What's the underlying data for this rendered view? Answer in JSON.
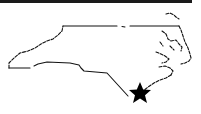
{
  "map": {
    "region": "North Carolina",
    "style": "outline",
    "outline_color": "#111111",
    "marker": {
      "type": "star-icon",
      "location": "Wilmington area (southeast coast)",
      "color": "#000000"
    }
  },
  "header_bar": {
    "color": "#1a1a1a"
  }
}
